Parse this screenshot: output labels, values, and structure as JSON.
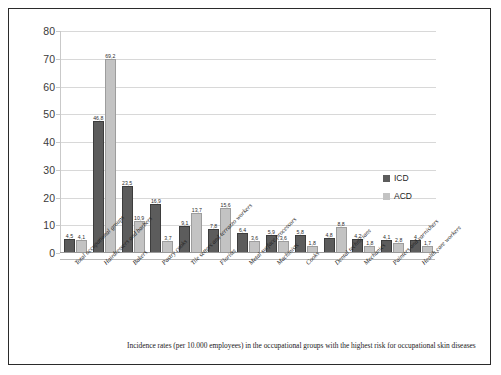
{
  "chart_data": {
    "type": "bar",
    "title": "",
    "xlabel": "",
    "ylabel": "",
    "ylim": [
      0,
      80
    ],
    "ytick_step": 10,
    "yticks": [
      "0",
      "10",
      "20",
      "30",
      "40",
      "50",
      "60",
      "70",
      "80"
    ],
    "grid": true,
    "legend_position": "right",
    "categories": [
      "Total occupational groups",
      "Hairdressers and barbers",
      "Bakers",
      "Pastry cooks",
      "Tile setters and terrazzo workers",
      "Florists",
      "Metal surface processors",
      "Machinists",
      "Cooks",
      "Dental technicians",
      "Mechanics",
      "Painters and varnishers",
      "Health care workers"
    ],
    "series": [
      {
        "name": "ICD",
        "color": "#5c5c5c",
        "values": [
          4.5,
          46.8,
          23.5,
          16.9,
          9.1,
          7.8,
          6.4,
          5.9,
          5.8,
          4.8,
          4.2,
          4.1,
          4.0
        ],
        "labels": [
          "4,5",
          "46,8",
          "23,5",
          "16,9",
          "9,1",
          "7,8",
          "6,4",
          "5,9",
          "5,8",
          "4,8",
          "4,2",
          "4,1",
          "4"
        ]
      },
      {
        "name": "ACD",
        "color": "#c3c3c3",
        "values": [
          4.1,
          69.2,
          10.9,
          3.7,
          13.7,
          15.6,
          3.6,
          3.6,
          1.8,
          8.8,
          1.8,
          2.8,
          1.7
        ],
        "labels": [
          "4,1",
          "69,2",
          "10,9",
          "3,7",
          "13,7",
          "15,6",
          "3,6",
          "3,6",
          "1,8",
          "8,8",
          "1,8",
          "2,8",
          "1,7"
        ]
      }
    ],
    "caption": "Incidence rates (per 10.000 employees) in the occupational groups with the highest risk for occupational skin diseases"
  }
}
